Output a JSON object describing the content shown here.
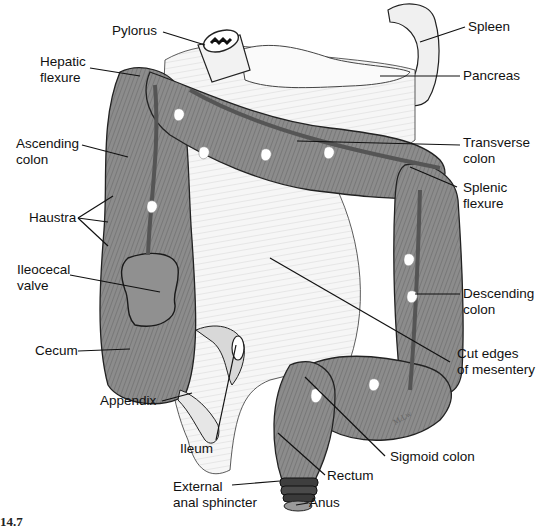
{
  "figure": {
    "number_fragment": "14.7"
  },
  "colors": {
    "colon_fill": "#8a8a8a",
    "colon_dark": "#5e5e5e",
    "mesentery_fill": "#f4f4f4",
    "line": "#111111",
    "background": "#ffffff"
  },
  "labels": {
    "pylorus": "Pylorus",
    "spleen": "Spleen",
    "hepatic_flexure_1": "Hepatic",
    "hepatic_flexure_2": "flexure",
    "pancreas": "Pancreas",
    "ascending_colon_1": "Ascending",
    "ascending_colon_2": "colon",
    "transverse_colon_1": "Transverse",
    "transverse_colon_2": "colon",
    "splenic_flexure_1": "Splenic",
    "splenic_flexure_2": "flexure",
    "haustra": "Haustra",
    "ileocecal_valve_1": "Ileocecal",
    "ileocecal_valve_2": "valve",
    "descending_colon_1": "Descending",
    "descending_colon_2": "colon",
    "cecum": "Cecum",
    "cut_edges_1": "Cut edges",
    "cut_edges_2": "of mesentery",
    "appendix": "Appendix",
    "ileum": "Ileum",
    "sigmoid_colon": "Sigmoid colon",
    "rectum": "Rectum",
    "external_anal_sphincter_1": "External",
    "external_anal_sphincter_2": "anal sphincter",
    "anus": "Anus"
  }
}
